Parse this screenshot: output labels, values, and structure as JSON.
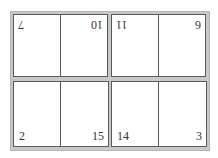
{
  "diagram": {
    "type": "imposition-layout",
    "sheet": {
      "top_row": [
        {
          "quadrant": "top-left",
          "pages": [
            {
              "number": "7",
              "rotated": true
            },
            {
              "number": "10",
              "rotated": true
            }
          ]
        },
        {
          "quadrant": "top-right",
          "pages": [
            {
              "number": "11",
              "rotated": true
            },
            {
              "number": "6",
              "rotated": true
            }
          ]
        }
      ],
      "bottom_row": [
        {
          "quadrant": "bottom-left",
          "pages": [
            {
              "number": "2",
              "rotated": false
            },
            {
              "number": "15",
              "rotated": false
            }
          ]
        },
        {
          "quadrant": "bottom-right",
          "pages": [
            {
              "number": "14",
              "rotated": false
            },
            {
              "number": "3",
              "rotated": false
            }
          ]
        }
      ]
    },
    "colors": {
      "frame": "#c9c9c9",
      "page_border": "#5a5a5a",
      "page_fill": "#ffffff",
      "text": "#333333"
    }
  }
}
